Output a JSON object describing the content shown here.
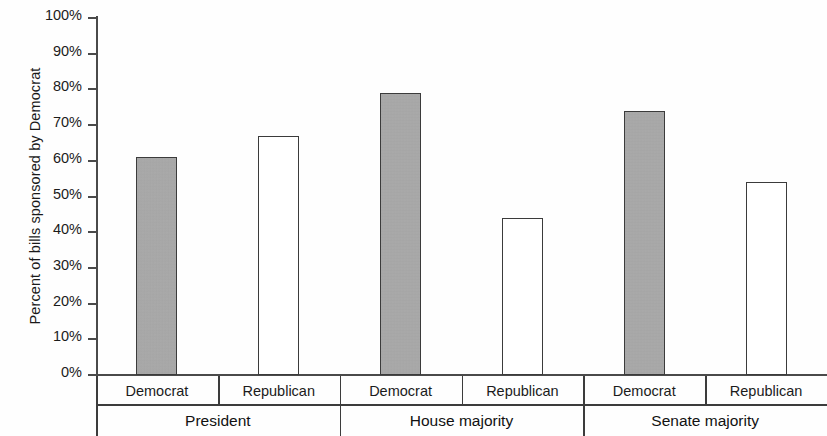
{
  "chart_data": {
    "type": "bar",
    "title": "",
    "subtitle": "",
    "xlabel": "",
    "ylabel": "Percent of bills sponsored by Democrat",
    "ylim": [
      0,
      100
    ],
    "y_unit": "%",
    "grid": false,
    "legend": "none",
    "y_ticks": [
      "0%",
      "10%",
      "20%",
      "30%",
      "40%",
      "50%",
      "60%",
      "70%",
      "80%",
      "90%",
      "100%"
    ],
    "y_tick_values": [
      0,
      10,
      20,
      30,
      40,
      50,
      60,
      70,
      80,
      90,
      100
    ],
    "groups": [
      {
        "name": "President",
        "categories": [
          "Democrat",
          "Republican"
        ],
        "values": [
          61,
          67
        ],
        "styles": [
          "filled",
          "hollow"
        ]
      },
      {
        "name": "House majority",
        "categories": [
          "Democrat",
          "Republican"
        ],
        "values": [
          79,
          44
        ],
        "styles": [
          "filled",
          "hollow"
        ]
      },
      {
        "name": "Senate majority",
        "categories": [
          "Democrat",
          "Republican"
        ],
        "values": [
          74,
          54
        ],
        "styles": [
          "filled",
          "hollow"
        ]
      }
    ],
    "colors": {
      "filled_bar": "#a9a9a9",
      "hollow_bar": "#ffffff",
      "bar_outline": "#3b3b3b",
      "axis": "#4a4a4a",
      "text": "#1b1b1b"
    }
  }
}
